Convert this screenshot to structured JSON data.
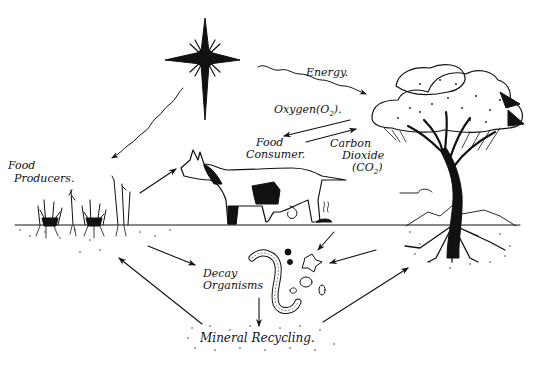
{
  "diagram": {
    "title": "",
    "type": "ecosystem nutrient and energy cycle illustration",
    "colors": {
      "ink": "#111111",
      "background": "#ffffff"
    },
    "nodes": {
      "sun": {
        "icon": "sun-star-icon"
      },
      "food_producers": {
        "line1": "Food",
        "line2": "Producers."
      },
      "food_consumer": {
        "line1": "Food",
        "line2": "Consumer."
      },
      "tree": {
        "icon": "acacia-tree-icon"
      },
      "decay_organisms": {
        "line1": "Decay",
        "line2": "Organisms"
      },
      "mineral_recycling": {
        "label": "Mineral Recycling."
      }
    },
    "flows": {
      "energy": {
        "label": "Energy."
      },
      "oxygen": {
        "label": "Oxygen",
        "formula": "(O",
        "sub": "2",
        "close": ")."
      },
      "carbon_dioxide": {
        "line1": "Carbon",
        "line2": "Dioxide",
        "formula": "(CO",
        "sub": "2",
        "close": ")"
      }
    },
    "edges": [
      {
        "from": "sun",
        "to": "food_producers",
        "style": "wavy"
      },
      {
        "from": "sun",
        "to": "tree",
        "label": "Energy.",
        "style": "wavy"
      },
      {
        "from": "tree",
        "to": "food_consumer",
        "label": "Oxygen (O2)"
      },
      {
        "from": "food_consumer",
        "to": "tree",
        "label": "Carbon Dioxide (CO2)"
      },
      {
        "from": "food_producers",
        "to": "food_consumer"
      },
      {
        "from": "food_producers",
        "to": "decay_organisms"
      },
      {
        "from": "food_consumer",
        "to": "decay_organisms"
      },
      {
        "from": "tree",
        "to": "decay_organisms"
      },
      {
        "from": "decay_organisms",
        "to": "mineral_recycling"
      },
      {
        "from": "mineral_recycling",
        "to": "food_producers"
      },
      {
        "from": "mineral_recycling",
        "to": "tree"
      }
    ]
  }
}
